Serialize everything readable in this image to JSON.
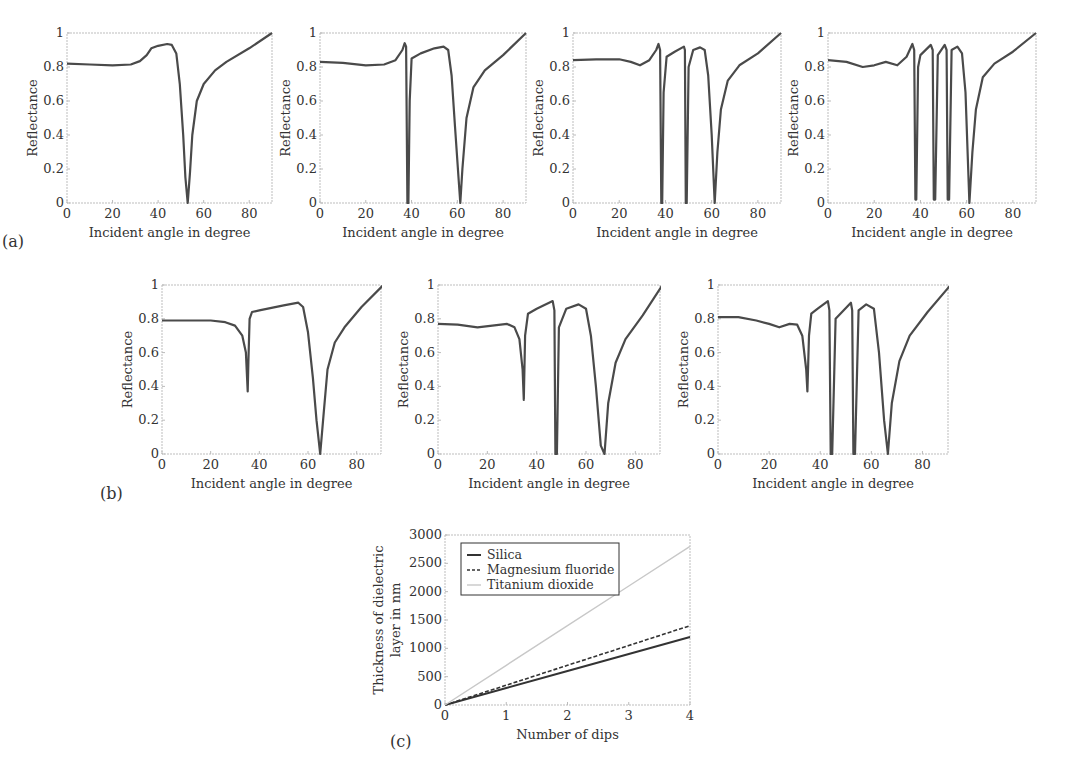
{
  "figure": {
    "panel_labels": [
      "(a)",
      "(b)",
      "(c)"
    ]
  },
  "colors": {
    "curve": "#4a4a4a",
    "silica": "#333333",
    "magnesium_fluoride": "#333333",
    "titanium_dioxide": "#c8c8c8",
    "frame": "#bdbdbd"
  },
  "chart_data": [
    {
      "id": "a1",
      "type": "line",
      "group": "(a)",
      "xlabel": "Incident angle in degree",
      "ylabel": "Reflectance",
      "xlim": [
        0,
        90
      ],
      "ylim": [
        0,
        1
      ],
      "xticks": [
        0,
        20,
        40,
        60,
        80
      ],
      "yticks": [
        0,
        0.2,
        0.4,
        0.6,
        0.8,
        1
      ],
      "ytick_labels": [
        "0",
        "0.2",
        "0.4",
        "0.6",
        "0.8",
        "1"
      ],
      "x": [
        0,
        10,
        20,
        28,
        32,
        35,
        37,
        40,
        44,
        46,
        48,
        49.5,
        51,
        52,
        53,
        54,
        55,
        57,
        60,
        65,
        70,
        80,
        90
      ],
      "y": [
        0.82,
        0.815,
        0.81,
        0.815,
        0.835,
        0.87,
        0.91,
        0.925,
        0.935,
        0.93,
        0.88,
        0.7,
        0.4,
        0.15,
        0.0,
        0.18,
        0.4,
        0.6,
        0.7,
        0.78,
        0.83,
        0.91,
        1.0
      ]
    },
    {
      "id": "a2",
      "type": "line",
      "group": "(a)",
      "xlabel": "Incident angle in degree",
      "ylabel": "Reflectance",
      "xlim": [
        0,
        90
      ],
      "ylim": [
        0,
        1
      ],
      "xticks": [
        0,
        20,
        40,
        60,
        80
      ],
      "yticks": [
        0,
        0.2,
        0.4,
        0.6,
        0.8,
        1
      ],
      "ytick_labels": [
        "0",
        "0.2",
        "0.4",
        "0.6",
        "0.8",
        "1"
      ],
      "x": [
        0,
        10,
        20,
        28,
        33,
        36,
        37,
        37.6,
        38.2,
        38.6,
        39.2,
        40,
        44,
        50,
        54,
        56,
        57.5,
        59,
        60.5,
        61.3,
        62.2,
        64,
        67,
        72,
        80,
        90
      ],
      "y": [
        0.83,
        0.825,
        0.81,
        0.815,
        0.84,
        0.9,
        0.94,
        0.92,
        0.0,
        0.0,
        0.6,
        0.85,
        0.88,
        0.91,
        0.92,
        0.9,
        0.75,
        0.45,
        0.15,
        0.0,
        0.2,
        0.5,
        0.68,
        0.78,
        0.87,
        1.0
      ]
    },
    {
      "id": "a3",
      "type": "line",
      "group": "(a)",
      "xlabel": "Incident angle in degree",
      "ylabel": "Reflectance",
      "xlim": [
        0,
        90
      ],
      "ylim": [
        0,
        1
      ],
      "xticks": [
        0,
        20,
        40,
        60,
        80
      ],
      "yticks": [
        0,
        0.2,
        0.4,
        0.6,
        0.8,
        1
      ],
      "ytick_labels": [
        "0",
        "0.2",
        "0.4",
        "0.6",
        "0.8",
        "1"
      ],
      "x": [
        0,
        10,
        20,
        25,
        29,
        33,
        36,
        37,
        37.7,
        38.2,
        38.6,
        39.2,
        40.5,
        44,
        48,
        48.4,
        48.8,
        49.2,
        50,
        52,
        55,
        57,
        58.5,
        60,
        61.3,
        62.5,
        64,
        67,
        72,
        80,
        90
      ],
      "y": [
        0.84,
        0.845,
        0.845,
        0.83,
        0.81,
        0.84,
        0.9,
        0.935,
        0.9,
        0.0,
        0.0,
        0.65,
        0.86,
        0.89,
        0.92,
        0.9,
        0.0,
        0.0,
        0.8,
        0.9,
        0.915,
        0.9,
        0.75,
        0.4,
        0.0,
        0.3,
        0.55,
        0.72,
        0.81,
        0.88,
        1.0
      ]
    },
    {
      "id": "a4",
      "type": "line",
      "group": "(a)",
      "xlabel": "Incident angle in degree",
      "ylabel": "Reflectance",
      "xlim": [
        0,
        90
      ],
      "ylim": [
        0,
        1
      ],
      "xticks": [
        0,
        20,
        40,
        60,
        80
      ],
      "yticks": [
        0,
        0.2,
        0.4,
        0.6,
        0.8,
        1
      ],
      "ytick_labels": [
        "0",
        "0.2",
        "0.4",
        "0.6",
        "0.8",
        "1"
      ],
      "x": [
        0,
        8,
        15,
        20,
        25,
        30,
        34,
        36.5,
        37.3,
        37.8,
        38.2,
        39,
        40,
        44.5,
        45.3,
        45.8,
        46.4,
        47.5,
        50.5,
        51.3,
        51.8,
        52.4,
        53.5,
        56,
        58,
        59.5,
        61.2,
        62.5,
        64,
        67,
        72,
        80,
        90
      ],
      "y": [
        0.84,
        0.83,
        0.8,
        0.81,
        0.83,
        0.81,
        0.86,
        0.935,
        0.9,
        0.02,
        0.02,
        0.8,
        0.87,
        0.93,
        0.9,
        0.02,
        0.02,
        0.87,
        0.93,
        0.9,
        0.02,
        0.02,
        0.9,
        0.92,
        0.88,
        0.65,
        0.0,
        0.3,
        0.55,
        0.74,
        0.82,
        0.89,
        1.0
      ]
    },
    {
      "id": "b1",
      "type": "line",
      "group": "(b)",
      "xlabel": "Incident angle in degree",
      "ylabel": "Reflectance",
      "xlim": [
        0,
        90
      ],
      "ylim": [
        0,
        1
      ],
      "xticks": [
        0,
        20,
        40,
        60,
        80
      ],
      "yticks": [
        0,
        0.2,
        0.4,
        0.6,
        0.8,
        1
      ],
      "ytick_labels": [
        "0",
        "0.2",
        "0.4",
        "0.6",
        "0.8",
        "1"
      ],
      "x": [
        0,
        10,
        20,
        26,
        30,
        33,
        34.5,
        35.2,
        35.5,
        36,
        37,
        40,
        50,
        56,
        58,
        60,
        62,
        63.5,
        65,
        66.5,
        68,
        71,
        75,
        82,
        91
      ],
      "y": [
        0.79,
        0.79,
        0.79,
        0.78,
        0.76,
        0.7,
        0.6,
        0.37,
        0.55,
        0.8,
        0.84,
        0.85,
        0.88,
        0.895,
        0.87,
        0.72,
        0.45,
        0.2,
        0.0,
        0.25,
        0.5,
        0.66,
        0.75,
        0.87,
        1.0
      ]
    },
    {
      "id": "b2",
      "type": "line",
      "group": "(b)",
      "xlabel": "Incident angle in degree",
      "ylabel": "Reflectance",
      "xlim": [
        0,
        90
      ],
      "ylim": [
        0,
        1
      ],
      "xticks": [
        0,
        20,
        40,
        60,
        80
      ],
      "yticks": [
        0,
        0.2,
        0.4,
        0.6,
        0.8,
        1
      ],
      "ytick_labels": [
        "0",
        "0.2",
        "0.4",
        "0.6",
        "0.8",
        "1"
      ],
      "x": [
        0,
        8,
        16,
        22,
        28,
        31,
        33,
        34.3,
        34.8,
        35.3,
        36.5,
        40,
        46.5,
        47.2,
        47.6,
        48.2,
        49,
        52,
        57,
        60,
        62,
        64,
        66,
        67.5,
        69,
        72,
        76,
        83,
        91
      ],
      "y": [
        0.77,
        0.765,
        0.75,
        0.76,
        0.77,
        0.75,
        0.68,
        0.5,
        0.32,
        0.7,
        0.83,
        0.86,
        0.905,
        0.85,
        0.0,
        0.0,
        0.75,
        0.86,
        0.885,
        0.86,
        0.7,
        0.4,
        0.05,
        0.0,
        0.3,
        0.54,
        0.68,
        0.82,
        1.0
      ]
    },
    {
      "id": "b3",
      "type": "line",
      "group": "(b)",
      "xlabel": "Incident angle in degree",
      "ylabel": "Reflectance",
      "xlim": [
        0,
        90
      ],
      "ylim": [
        0,
        1
      ],
      "xticks": [
        0,
        20,
        40,
        60,
        80
      ],
      "yticks": [
        0,
        0.2,
        0.4,
        0.6,
        0.8,
        1
      ],
      "ytick_labels": [
        "0",
        "0.2",
        "0.4",
        "0.6",
        "0.8",
        "1"
      ],
      "x": [
        0,
        8,
        15,
        20,
        24,
        28,
        31,
        33,
        34.5,
        35,
        35.6,
        36.5,
        39,
        43,
        43.6,
        44.1,
        44.7,
        46,
        52,
        52.5,
        53,
        53.6,
        55,
        58,
        61,
        63,
        65,
        66.5,
        68,
        71,
        75,
        82,
        91
      ],
      "y": [
        0.81,
        0.81,
        0.79,
        0.77,
        0.75,
        0.77,
        0.765,
        0.7,
        0.5,
        0.37,
        0.7,
        0.83,
        0.86,
        0.905,
        0.85,
        0.0,
        0.0,
        0.8,
        0.895,
        0.85,
        0.0,
        0.0,
        0.85,
        0.885,
        0.86,
        0.6,
        0.2,
        0.0,
        0.3,
        0.55,
        0.7,
        0.84,
        1.0
      ]
    },
    {
      "id": "c",
      "type": "line",
      "group": "(c)",
      "xlabel": "Number of dips",
      "ylabel_lines": [
        "Thickness of dielectric",
        "layer in nm"
      ],
      "xlim": [
        0,
        4
      ],
      "ylim": [
        0,
        3000
      ],
      "xticks": [
        0,
        1,
        2,
        3,
        4
      ],
      "yticks": [
        0,
        500,
        1000,
        1500,
        2000,
        2500,
        3000
      ],
      "ytick_labels": [
        "0",
        "500",
        "1000",
        "1500",
        "2000",
        "2500",
        "3000"
      ],
      "legend": {
        "placement": "top-left",
        "entries": [
          "Silica",
          "Magnesium fluoride",
          "Titanium dioxide"
        ]
      },
      "series": [
        {
          "name": "Silica",
          "style": "solid",
          "x": [
            0,
            1,
            2,
            3,
            4
          ],
          "y": [
            0,
            300,
            600,
            900,
            1200
          ]
        },
        {
          "name": "Magnesium fluoride",
          "style": "dashed",
          "x": [
            0,
            1,
            2,
            3,
            4
          ],
          "y": [
            0,
            350,
            700,
            1050,
            1400
          ]
        },
        {
          "name": "Titanium dioxide",
          "style": "solid-light",
          "x": [
            0,
            1,
            2,
            3,
            4
          ],
          "y": [
            0,
            700,
            1400,
            2100,
            2800
          ]
        }
      ]
    }
  ]
}
